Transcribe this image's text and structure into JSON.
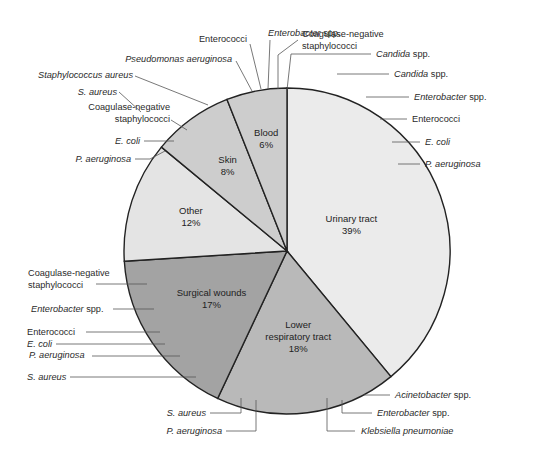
{
  "chart_data": {
    "type": "pie",
    "title": "",
    "start": "12 o'clock, clockwise",
    "slices": [
      {
        "name": "Urinary tract",
        "value": 39,
        "label": "39%",
        "color": "#ebebeb",
        "organisms": [
          "Candida spp.",
          "Enterobacter spp.",
          "Enterococci",
          "E. coli",
          "P. aeruginosa"
        ]
      },
      {
        "name": "Lower respiratory tract",
        "value": 18,
        "label": "18%",
        "color": "#b9b9b9",
        "organisms": [
          "Acinetobacter spp.",
          "Enterobacter spp.",
          "Klebsiella pneumoniae",
          "P. aeruginosa",
          "S. aureus"
        ]
      },
      {
        "name": "Surgical wounds",
        "value": 17,
        "label": "17%",
        "color": "#a3a3a3",
        "organisms": [
          "S. aureus",
          "P. aeruginosa",
          "E. coli",
          "Enterococci",
          "Enterobacter spp.",
          "Coagulase-negative staphylococci"
        ]
      },
      {
        "name": "Other",
        "value": 12,
        "label": "12%",
        "color": "#e4e4e4",
        "organisms": []
      },
      {
        "name": "Skin",
        "value": 8,
        "label": "8%",
        "color": "#cdcdcd",
        "organisms": [
          "P. aeruginosa",
          "E. coli",
          "Coagulase-negative staphylococci",
          "S. aureus"
        ]
      },
      {
        "name": "Blood",
        "value": 6,
        "label": "6%",
        "color": "#cdcdcd",
        "organisms": [
          "Staphylococcus aureus",
          "Pseudomonas aeruginosa",
          "Enterococci",
          "Enterobacter spp.",
          "Coagulase-negative staphylococci",
          "Candida spp."
        ]
      }
    ],
    "callouts": [
      {
        "slice": "Urinary tract",
        "parts": [
          [
            "Candida",
            true
          ],
          [
            " spp.",
            false
          ]
        ]
      },
      {
        "slice": "Urinary tract",
        "parts": [
          [
            "Enterobacter",
            true
          ],
          [
            " spp.",
            false
          ]
        ]
      },
      {
        "slice": "Urinary tract",
        "parts": [
          [
            "Enterococci",
            false
          ]
        ]
      },
      {
        "slice": "Urinary tract",
        "parts": [
          [
            "E. coli",
            true
          ]
        ]
      },
      {
        "slice": "Urinary tract",
        "parts": [
          [
            "P. aeruginosa",
            true
          ]
        ]
      },
      {
        "slice": "Lower respiratory tract",
        "parts": [
          [
            "Acinetobacter",
            true
          ],
          [
            " spp.",
            false
          ]
        ]
      },
      {
        "slice": "Lower respiratory tract",
        "parts": [
          [
            "Enterobacter",
            true
          ],
          [
            " spp.",
            false
          ]
        ]
      },
      {
        "slice": "Lower respiratory tract",
        "parts": [
          [
            "Klebsiella pneumoniae",
            true
          ]
        ]
      },
      {
        "slice": "Lower respiratory tract",
        "parts": [
          [
            "P. aeruginosa",
            true
          ]
        ]
      },
      {
        "slice": "Lower respiratory tract",
        "parts": [
          [
            "S. aureus",
            true
          ]
        ]
      },
      {
        "slice": "Surgical wounds",
        "parts": [
          [
            "S. aureus",
            true
          ]
        ]
      },
      {
        "slice": "Surgical wounds",
        "parts": [
          [
            "P. aeruginosa",
            true
          ]
        ]
      },
      {
        "slice": "Surgical wounds",
        "parts": [
          [
            "E. coli",
            true
          ]
        ]
      },
      {
        "slice": "Surgical wounds",
        "parts": [
          [
            "Enterococci",
            false
          ]
        ]
      },
      {
        "slice": "Surgical wounds",
        "parts": [
          [
            "Enterobacter",
            true
          ],
          [
            " spp.",
            false
          ]
        ]
      },
      {
        "slice": "Surgical wounds",
        "parts": [
          [
            "Coagulase-negative",
            false
          ]
        ],
        "line2": "staphylococci"
      },
      {
        "slice": "Skin",
        "parts": [
          [
            "P. aeruginosa",
            true
          ]
        ]
      },
      {
        "slice": "Skin",
        "parts": [
          [
            "E. coli",
            true
          ]
        ]
      },
      {
        "slice": "Skin",
        "parts": [
          [
            "Coagulase-negative",
            false
          ]
        ],
        "line2": "staphylococci"
      },
      {
        "slice": "Skin",
        "parts": [
          [
            "S. aureus",
            true
          ]
        ]
      },
      {
        "slice": "Blood",
        "parts": [
          [
            "Staphylococcus aureus",
            true
          ]
        ]
      },
      {
        "slice": "Blood",
        "parts": [
          [
            "Pseudomonas aeruginosa",
            true
          ]
        ]
      },
      {
        "slice": "Blood",
        "parts": [
          [
            "Enterococci",
            false
          ]
        ]
      },
      {
        "slice": "Blood",
        "parts": [
          [
            "Enterobacter",
            true
          ],
          [
            " spp.",
            false
          ]
        ]
      },
      {
        "slice": "Blood",
        "parts": [
          [
            "Coagulase-negative",
            false
          ]
        ],
        "line2": "staphylococci"
      },
      {
        "slice": "Blood",
        "parts": [
          [
            "Candida",
            true
          ],
          [
            " spp.",
            false
          ]
        ]
      }
    ]
  }
}
